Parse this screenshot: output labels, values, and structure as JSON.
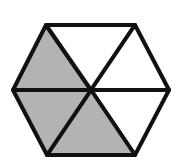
{
  "diagram": {
    "shape": "regular hexagon divided into 6 equilateral triangles",
    "total_parts": 6,
    "shaded_parts": 3,
    "colors": {
      "shaded": "#b3b3b3",
      "unshaded": "#ffffff",
      "stroke": "#111111"
    },
    "triangles": [
      {
        "id": "upper-left",
        "shaded": true
      },
      {
        "id": "top",
        "shaded": false
      },
      {
        "id": "upper-right",
        "shaded": false
      },
      {
        "id": "lower-right",
        "shaded": false
      },
      {
        "id": "bottom",
        "shaded": true
      },
      {
        "id": "lower-left",
        "shaded": true
      }
    ]
  }
}
